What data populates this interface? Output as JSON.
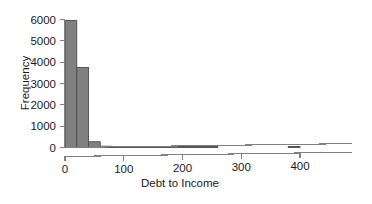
{
  "chart_data": {
    "type": "bar",
    "title": "",
    "subtitle": "",
    "xlabel": "Debt to Income",
    "ylabel": "Frequency",
    "xlim": [
      -10,
      480
    ],
    "ylim": [
      0,
      6000
    ],
    "grid": false,
    "legend": null,
    "bin_width": 20,
    "bin_edges": [
      0,
      20,
      40,
      60,
      80,
      100,
      120,
      140,
      160,
      180,
      200,
      220,
      240,
      260,
      280,
      300,
      320,
      340,
      360,
      380,
      400
    ],
    "categories": [
      "0-20",
      "20-40",
      "40-60",
      "60-80",
      "80-100",
      "100-120",
      "120-140",
      "140-160",
      "160-180",
      "180-200",
      "200-220",
      "220-240",
      "240-260",
      "260-280",
      "280-300",
      "300-320",
      "320-340",
      "340-360",
      "360-380",
      "380-400"
    ],
    "values": [
      5950,
      3750,
      270,
      60,
      15,
      8,
      5,
      3,
      2,
      2,
      1,
      1,
      1,
      0,
      0,
      0,
      0,
      0,
      0,
      1
    ],
    "xticks": [
      0,
      100,
      200,
      300,
      400
    ],
    "xtick_labels": [
      "0",
      "100",
      "200",
      "300",
      "400"
    ],
    "yticks": [
      0,
      1000,
      2000,
      3000,
      4000,
      5000,
      6000
    ],
    "ytick_labels": [
      "0",
      "1000",
      "2000",
      "3000",
      "4000",
      "5000",
      "6000"
    ],
    "bar_fill_color": "#808080",
    "bar_edge_color": "#4d4d4d",
    "axis_color": "#808080",
    "text_color": "#1a1a1a",
    "background_color": "#ffffff"
  }
}
